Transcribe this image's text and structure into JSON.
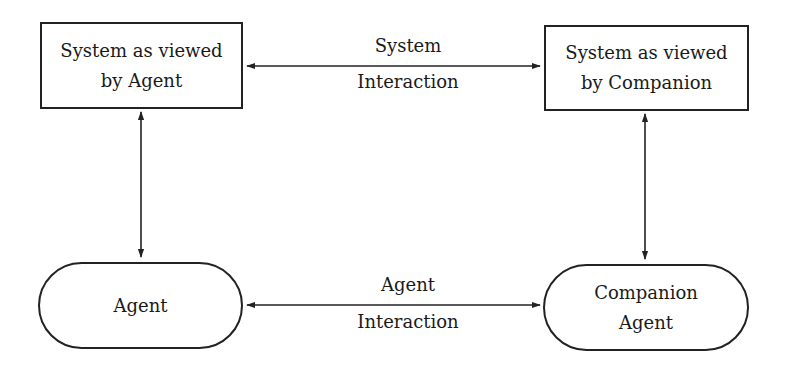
{
  "diagram": {
    "nodes": {
      "system_agent": {
        "line1": "System as viewed",
        "line2": "by Agent",
        "shape": "rectangle"
      },
      "system_companion": {
        "line1": "System as viewed",
        "line2": "by Companion",
        "shape": "rectangle"
      },
      "agent": {
        "line1": "Agent",
        "shape": "rounded-pill"
      },
      "companion_agent": {
        "line1": "Companion",
        "line2": "Agent",
        "shape": "rounded-pill"
      }
    },
    "edges": {
      "system_interaction": {
        "above": "System",
        "below": "Interaction",
        "from": "system_agent",
        "to": "system_companion",
        "direction": "bidirectional"
      },
      "agent_interaction": {
        "above": "Agent",
        "below": "Interaction",
        "from": "agent",
        "to": "companion_agent",
        "direction": "bidirectional"
      },
      "left_vertical": {
        "from": "system_agent",
        "to": "agent",
        "direction": "bidirectional"
      },
      "right_vertical": {
        "from": "system_companion",
        "to": "companion_agent",
        "direction": "bidirectional"
      }
    },
    "colors": {
      "stroke": "#222222",
      "background": "#ffffff"
    }
  }
}
